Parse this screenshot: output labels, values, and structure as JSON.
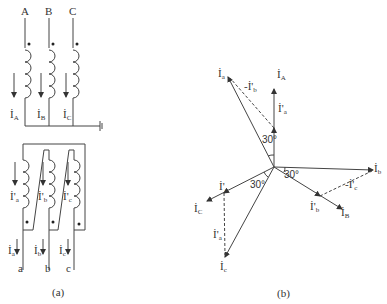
{
  "figure_a": {
    "caption": "(a)",
    "primary_terminals": [
      "A",
      "B",
      "C"
    ],
    "primary_currents": [
      {
        "main": "İ",
        "sub": "A"
      },
      {
        "main": "İ",
        "sub": "B"
      },
      {
        "main": "İ",
        "sub": "C"
      }
    ],
    "secondary_winding_currents": [
      {
        "main": "İ'",
        "sub": "a"
      },
      {
        "main": "İ'",
        "sub": "b"
      },
      {
        "main": "İ'",
        "sub": "c"
      }
    ],
    "secondary_line_currents": [
      {
        "main": "İ",
        "sub": "a"
      },
      {
        "main": "İ",
        "sub": "b"
      },
      {
        "main": "İ",
        "sub": "c"
      }
    ],
    "secondary_terminals": [
      "a",
      "b",
      "c"
    ]
  },
  "figure_b": {
    "caption": "(b)",
    "phasors": {
      "IA": {
        "main": "İ",
        "sub": "A"
      },
      "IB": {
        "main": "İ",
        "sub": "B"
      },
      "IC": {
        "main": "İ",
        "sub": "C"
      },
      "Ia": {
        "main": "İ",
        "sub": "a"
      },
      "Ib": {
        "main": "İ",
        "sub": "b"
      },
      "Ic": {
        "main": "İ",
        "sub": "c"
      },
      "Ia_p": {
        "main": "İ'",
        "sub": "a"
      },
      "Ib_p": {
        "main": "İ'",
        "sub": "b"
      },
      "Ic_p": {
        "main": "İ'",
        "sub": "c"
      },
      "neg_Ib_p": {
        "main": "-İ'",
        "sub": "b"
      },
      "neg_Ic_p": {
        "main": "-İ'",
        "sub": "c"
      },
      "neg_Ia_p": {
        "main": "İ'",
        "sub": "a"
      }
    },
    "angles": [
      "30°",
      "30°",
      "30°"
    ]
  }
}
